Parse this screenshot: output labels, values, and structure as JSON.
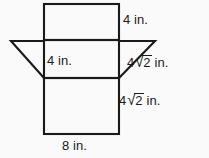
{
  "figure": {
    "background_color": "#fafafa",
    "line_color": "#1a1a1a",
    "labels": {
      "top_right": {
        "text": "4 in.",
        "value": 4,
        "unit": "in."
      },
      "interior": {
        "text": "4 in.",
        "value": 4,
        "unit": "in."
      },
      "diagonal_right": {
        "coefficient": "4",
        "radical_sign": "√",
        "radicand": "2",
        "unit": "in.",
        "text": "4√2 in."
      },
      "mid_right": {
        "coefficient": "4",
        "radical_sign": "√",
        "radicand": "2",
        "unit": "in.",
        "text": "4√2 in."
      },
      "bottom": {
        "text": "8 in.",
        "value": 8,
        "unit": "in."
      }
    },
    "geometry": {
      "top_rectangle": {
        "x1": 44,
        "y1": 4,
        "x2": 119,
        "y2": 40
      },
      "middle_band": {
        "x1": 44,
        "y1": 40,
        "x2": 119,
        "y2": 78
      },
      "bottom_rectangle": {
        "x1": 44,
        "y1": 78,
        "x2": 119,
        "y2": 134
      },
      "left_flap": {
        "apex_x": 11,
        "apex_y": 41,
        "base_x": 44,
        "base_y": 78
      },
      "right_flap": {
        "apex_x": 155,
        "apex_y": 41,
        "base_x": 119,
        "base_y": 78
      }
    }
  }
}
